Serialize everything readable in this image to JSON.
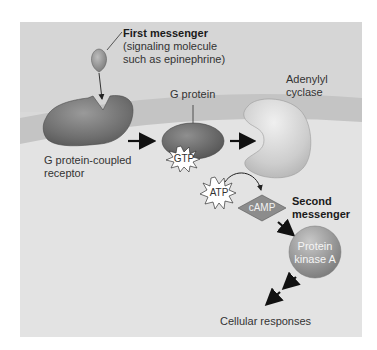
{
  "figure": {
    "colors": {
      "panel_background": "#d9d9d9",
      "cytoplasm": "#e4e4e4",
      "membrane": "#c8c8c8",
      "receptor": "#7a7a7a",
      "g_protein": "#6e6e6e",
      "adenylyl_cyclase": "#cfcfcf",
      "kinase": "#9a9a9a",
      "camp": "#8a8a8a",
      "arrow": "#111111"
    }
  },
  "labels": {
    "first_messenger_title": "First messenger",
    "first_messenger_desc_line1": "(signaling molecule",
    "first_messenger_desc_line2": "such as epinephrine)",
    "g_protein": "G protein",
    "adenylyl_line1": "Adenylyl",
    "adenylyl_line2": "cyclase",
    "receptor_line1": "G protein-coupled",
    "receptor_line2": "receptor",
    "gtp": "GTP",
    "atp": "ATP",
    "camp": "cAMP",
    "second_messenger_line1": "Second",
    "second_messenger_line2": "messenger",
    "kinase_line1": "Protein",
    "kinase_line2": "kinase A",
    "cellular_responses": "Cellular responses"
  },
  "flow": [
    "First messenger",
    "G protein-coupled receptor",
    "G protein",
    "Adenylyl cyclase",
    "ATP → cAMP",
    "Protein kinase A",
    "Cellular responses"
  ]
}
